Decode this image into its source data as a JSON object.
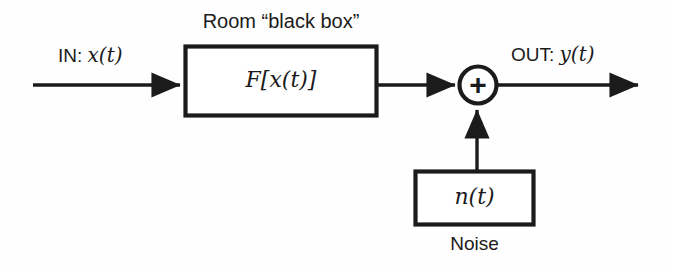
{
  "diagram": {
    "type": "signal-flow-block-diagram",
    "title_label": "Room “black box”",
    "input_label_prefix": "IN:",
    "input_signal": "x(t)",
    "output_label_prefix": "OUT:",
    "output_signal": "y(t)",
    "system_block_label": "F[x(t)]",
    "noise_block_label": "n(t)",
    "noise_caption": "Noise",
    "summing_junction_symbol": "+",
    "colors": {
      "stroke": "#1b1b1b",
      "background": "#fefefe",
      "text": "#1b1b1b"
    },
    "nodes": [
      {
        "name": "input-arrow",
        "kind": "arrow",
        "from_x": 33,
        "to_x": 184,
        "y": 85
      },
      {
        "name": "system-block",
        "kind": "rect",
        "x": 184,
        "y": 45,
        "width": 194,
        "height": 72
      },
      {
        "name": "block-to-sum-arrow",
        "kind": "arrow",
        "from_x": 378,
        "to_x": 458,
        "y": 85
      },
      {
        "name": "summing-junction",
        "kind": "circle",
        "cx": 478,
        "cy": 85,
        "r": 20
      },
      {
        "name": "noise-arrow",
        "kind": "arrow-up",
        "x": 477,
        "from_y": 170,
        "to_y": 106
      },
      {
        "name": "noise-block",
        "kind": "rect",
        "x": 414,
        "y": 170,
        "width": 121,
        "height": 56
      },
      {
        "name": "output-arrow",
        "kind": "arrow",
        "from_x": 498,
        "to_x": 642,
        "y": 85
      }
    ]
  }
}
